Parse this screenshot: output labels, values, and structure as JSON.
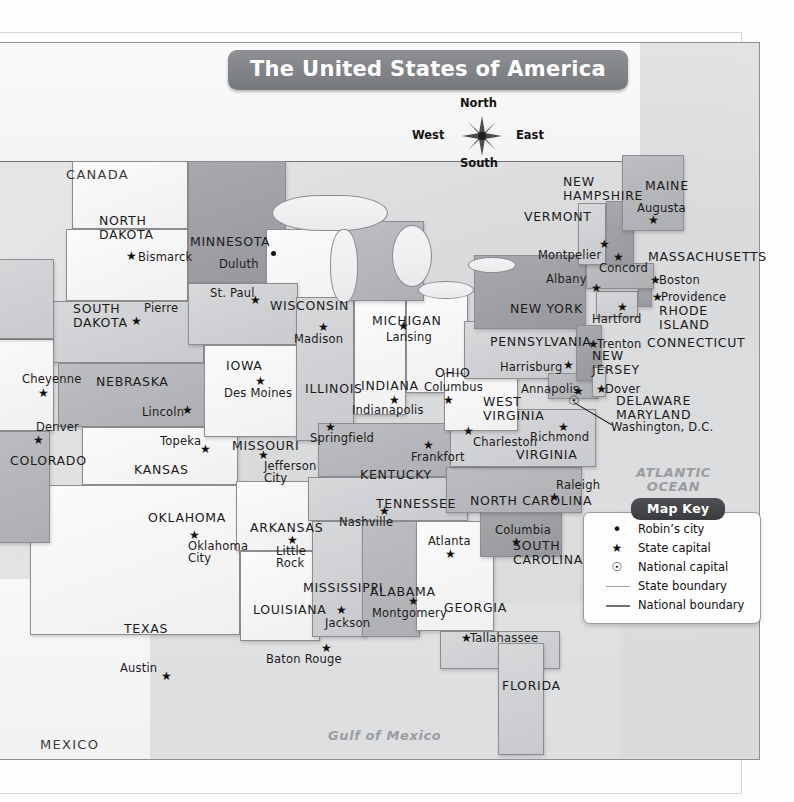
{
  "title": "The United States of America",
  "compass": {
    "north": "North",
    "south": "South",
    "east": "East",
    "west": "West"
  },
  "countries": [
    {
      "name": "CANADA",
      "x": 66,
      "y": 126
    },
    {
      "name": "MEXICO",
      "x": 40,
      "y": 696
    }
  ],
  "water_labels": [
    {
      "name": "ATLANTIC\nOCEAN",
      "x": 636,
      "y": 424
    },
    {
      "name": "Gulf of Mexico",
      "x": 328,
      "y": 687
    }
  ],
  "map_key": {
    "title": "Map Key",
    "items": [
      {
        "symbol": "dot",
        "glyph": "•",
        "label": "Robin’s city"
      },
      {
        "symbol": "star",
        "glyph": "★",
        "label": "State capital"
      },
      {
        "symbol": "natcap",
        "glyph": "☉",
        "label": "National capital"
      },
      {
        "symbol": "line-light",
        "glyph": "",
        "label": "State boundary"
      },
      {
        "symbol": "line-dark",
        "glyph": "",
        "label": "National boundary"
      }
    ]
  },
  "states": [
    {
      "name": "NORTH\nDAKOTA",
      "x": 99,
      "y": 172
    },
    {
      "name": "SOUTH\nDAKOTA",
      "x": 73,
      "y": 260
    },
    {
      "name": "MINNESOTA",
      "x": 190,
      "y": 193
    },
    {
      "name": "WISCONSIN",
      "x": 270,
      "y": 257
    },
    {
      "name": "MICHIGAN",
      "x": 372,
      "y": 272
    },
    {
      "name": "IOWA",
      "x": 226,
      "y": 317
    },
    {
      "name": "NEBRASKA",
      "x": 96,
      "y": 333
    },
    {
      "name": "COLORADO",
      "x": 10,
      "y": 412
    },
    {
      "name": "KANSAS",
      "x": 134,
      "y": 421
    },
    {
      "name": "MISSOURI",
      "x": 232,
      "y": 397
    },
    {
      "name": "ILLINOIS",
      "x": 305,
      "y": 340
    },
    {
      "name": "INDIANA",
      "x": 361,
      "y": 337
    },
    {
      "name": "OHIO",
      "x": 435,
      "y": 324
    },
    {
      "name": "KENTUCKY",
      "x": 360,
      "y": 426
    },
    {
      "name": "TENNESSEE",
      "x": 376,
      "y": 455
    },
    {
      "name": "OKLAHOMA",
      "x": 148,
      "y": 469
    },
    {
      "name": "ARKANSAS",
      "x": 250,
      "y": 479
    },
    {
      "name": "TEXAS",
      "x": 124,
      "y": 580
    },
    {
      "name": "LOUISIANA",
      "x": 253,
      "y": 561
    },
    {
      "name": "MISSISSIPPI",
      "x": 303,
      "y": 539
    },
    {
      "name": "ALABAMA",
      "x": 370,
      "y": 543
    },
    {
      "name": "GEORGIA",
      "x": 444,
      "y": 559
    },
    {
      "name": "FLORIDA",
      "x": 502,
      "y": 637
    },
    {
      "name": "SOUTH\nCAROLINA",
      "x": 513,
      "y": 497
    },
    {
      "name": "NORTH CAROLINA",
      "x": 470,
      "y": 452
    },
    {
      "name": "VIRGINIA",
      "x": 516,
      "y": 406
    },
    {
      "name": "WEST\nVIRGINIA",
      "x": 483,
      "y": 353
    },
    {
      "name": "PENNSYLVANIA",
      "x": 490,
      "y": 293
    },
    {
      "name": "NEW YORK",
      "x": 510,
      "y": 260
    },
    {
      "name": "VERMONT",
      "x": 524,
      "y": 168
    },
    {
      "name": "NEW\nHAMPSHIRE",
      "x": 563,
      "y": 133
    },
    {
      "name": "MAINE",
      "x": 645,
      "y": 137
    },
    {
      "name": "MASSACHUSETTS",
      "x": 648,
      "y": 208
    },
    {
      "name": "RHODE\nISLAND",
      "x": 659,
      "y": 262
    },
    {
      "name": "CONNECTICUT",
      "x": 647,
      "y": 294
    },
    {
      "name": "NEW\nJERSEY",
      "x": 592,
      "y": 307
    },
    {
      "name": "DELAWARE",
      "x": 616,
      "y": 352
    },
    {
      "name": "MARYLAND",
      "x": 616,
      "y": 366
    }
  ],
  "capitals": [
    {
      "name": "Bismarck",
      "lx": 138,
      "ly": 209,
      "sx": 126,
      "sy": 208
    },
    {
      "name": "Pierre",
      "lx": 144,
      "ly": 260,
      "sx": 131,
      "sy": 273
    },
    {
      "name": "St. Paul",
      "lx": 210,
      "ly": 245,
      "sx": 250,
      "sy": 252
    },
    {
      "name": "Madison",
      "lx": 294,
      "ly": 291,
      "sx": 318,
      "sy": 279
    },
    {
      "name": "Lansing",
      "lx": 386,
      "ly": 289,
      "sx": 398,
      "sy": 278
    },
    {
      "name": "Des Moines",
      "lx": 224,
      "ly": 345,
      "sx": 255,
      "sy": 333
    },
    {
      "name": "Lincoln",
      "lx": 142,
      "ly": 364,
      "sx": 182,
      "sy": 362
    },
    {
      "name": "Cheyenne",
      "lx": 22,
      "ly": 331,
      "sx": 38,
      "sy": 345
    },
    {
      "name": "Denver",
      "lx": 36,
      "ly": 379,
      "sx": 33,
      "sy": 392
    },
    {
      "name": "Topeka",
      "lx": 160,
      "ly": 393,
      "sx": 200,
      "sy": 401
    },
    {
      "name": "Jefferson\nCity",
      "lx": 264,
      "ly": 418,
      "sx": 258,
      "sy": 407
    },
    {
      "name": "Springfield",
      "lx": 310,
      "ly": 390,
      "sx": 325,
      "sy": 379
    },
    {
      "name": "Indianapolis",
      "lx": 352,
      "ly": 362,
      "sx": 389,
      "sy": 352
    },
    {
      "name": "Columbus",
      "lx": 424,
      "ly": 339,
      "sx": 443,
      "sy": 352
    },
    {
      "name": "Frankfort",
      "lx": 411,
      "ly": 409,
      "sx": 423,
      "sy": 397
    },
    {
      "name": "Charleston",
      "lx": 473,
      "ly": 394,
      "sx": 463,
      "sy": 383
    },
    {
      "name": "Richmond",
      "lx": 530,
      "ly": 389,
      "sx": 558,
      "sy": 379
    },
    {
      "name": "Raleigh",
      "lx": 556,
      "ly": 437,
      "sx": 549,
      "sy": 449
    },
    {
      "name": "Columbia",
      "lx": 495,
      "ly": 482,
      "sx": 511,
      "sy": 494
    },
    {
      "name": "Atlanta",
      "lx": 428,
      "ly": 493,
      "sx": 445,
      "sy": 506
    },
    {
      "name": "Tallahassee",
      "lx": 470,
      "ly": 590,
      "sx": 461,
      "sy": 590
    },
    {
      "name": "Montgomery",
      "lx": 372,
      "ly": 565,
      "sx": 408,
      "sy": 553
    },
    {
      "name": "Jackson",
      "lx": 325,
      "ly": 575,
      "sx": 336,
      "sy": 562
    },
    {
      "name": "Baton Rouge",
      "lx": 266,
      "ly": 611,
      "sx": 321,
      "sy": 600
    },
    {
      "name": "Little\nRock",
      "lx": 276,
      "ly": 503,
      "sx": 287,
      "sy": 492
    },
    {
      "name": "Nashville",
      "lx": 339,
      "ly": 474,
      "sx": 379,
      "sy": 463
    },
    {
      "name": "Austin",
      "lx": 120,
      "ly": 620,
      "sx": 161,
      "sy": 628
    },
    {
      "name": "Oklahoma\nCity",
      "lx": 188,
      "ly": 498,
      "sx": 189,
      "sy": 487
    },
    {
      "name": "Harrisburg",
      "lx": 500,
      "ly": 319,
      "sx": 563,
      "sy": 317
    },
    {
      "name": "Annapolis",
      "lx": 521,
      "ly": 341,
      "sx": 573,
      "sy": 343
    },
    {
      "name": "Dover",
      "lx": 605,
      "ly": 341,
      "sx": 596,
      "sy": 341
    },
    {
      "name": "Trenton",
      "lx": 597,
      "ly": 296,
      "sx": 588,
      "sy": 296
    },
    {
      "name": "Hartford",
      "lx": 592,
      "ly": 271,
      "sx": 617,
      "sy": 259
    },
    {
      "name": "Providence",
      "lx": 661,
      "ly": 249,
      "sx": 652,
      "sy": 249
    },
    {
      "name": "Boston",
      "lx": 659,
      "ly": 232,
      "sx": 650,
      "sy": 232
    },
    {
      "name": "Albany",
      "lx": 546,
      "ly": 231,
      "sx": 591,
      "sy": 240
    },
    {
      "name": "Concord",
      "lx": 599,
      "ly": 220,
      "sx": 613,
      "sy": 209
    },
    {
      "name": "Montpelier",
      "lx": 538,
      "ly": 207,
      "sx": 599,
      "sy": 196
    },
    {
      "name": "Augusta",
      "lx": 637,
      "ly": 160,
      "sx": 648,
      "sy": 172
    }
  ],
  "cities": [
    {
      "name": "Duluth",
      "lx": 219,
      "ly": 216,
      "dx": 271,
      "dy": 209
    }
  ],
  "national_capital": {
    "name": "Washington, D.C.",
    "lx": 611,
    "ly": 379,
    "mx": 568,
    "my": 352
  },
  "colors": {
    "title_banner": "#75787c",
    "key_banner": "#393b3e",
    "ocean": "#dcdddf",
    "state_boundary": "#9a9c9f",
    "national_boundary": "#6f7174",
    "land_light": "#f4f4f5",
    "land_mid": "#cbcccf",
    "land_dark": "#acaeb2"
  }
}
